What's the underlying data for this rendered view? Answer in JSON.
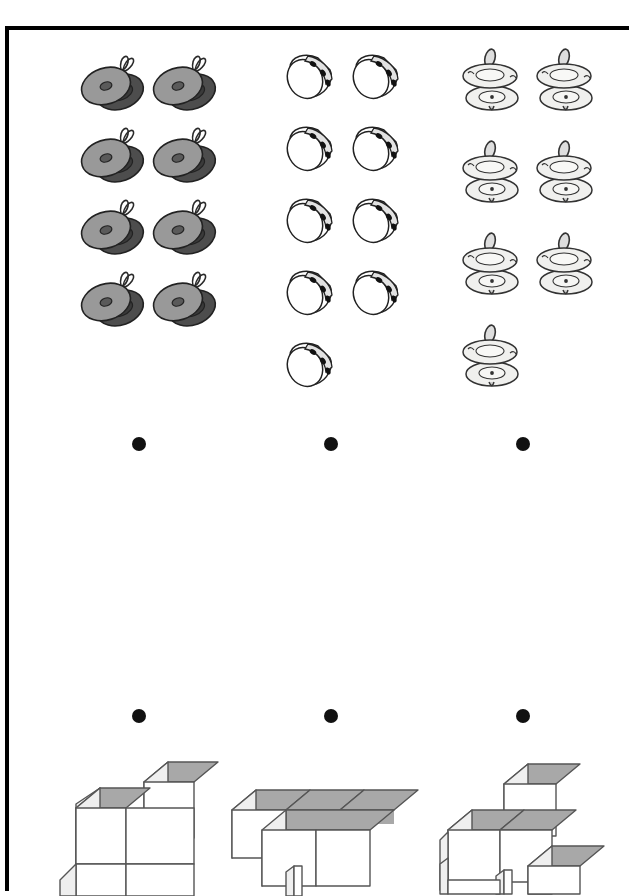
{
  "page": {
    "background_color": "#ffffff",
    "frame_color": "#000000",
    "width": 631,
    "height": 891
  },
  "worksheet": {
    "title": "",
    "instruction": ""
  },
  "groups": [
    {
      "id": "group-cymbals",
      "icon_name": "hand-cymbals-icon",
      "label": "",
      "count": 8,
      "rows": 4,
      "per_row": 2,
      "color": "#999999",
      "shadow_color": "#4d4d4d",
      "outline_color": "#222222"
    },
    {
      "id": "group-tambourines",
      "icon_name": "tambourine-icon",
      "label": "",
      "count": 9,
      "rows": 5,
      "per_row": 2,
      "color": "#ffffff",
      "shadow_color": "#c9c9c9",
      "outline_color": "#222222"
    },
    {
      "id": "group-finger-cymbals",
      "icon_name": "finger-cymbals-icon",
      "label": "",
      "count": 7,
      "rows": 4,
      "per_row": 2,
      "color": "#f0f0ee",
      "shadow_color": "#d8d8d4",
      "outline_color": "#333333"
    }
  ],
  "bullets": {
    "marker": "•",
    "color": "#111111",
    "row_top": [
      "answer-slot-1",
      "answer-slot-2",
      "answer-slot-3"
    ],
    "row_bottom": [
      "answer-slot-4",
      "answer-slot-5",
      "answer-slot-6"
    ]
  },
  "answers": {
    "row_top": [
      "",
      "",
      ""
    ],
    "row_bottom": [
      "",
      "",
      ""
    ]
  },
  "cube_figures": [
    {
      "id": "cube-figure-1",
      "name": "cube-stack-left",
      "cube_count": 4,
      "top_face_color": "#a8a8a8",
      "side_face_color": "#e8e8e8",
      "front_face_color": "#ffffff",
      "edge_color": "#555555"
    },
    {
      "id": "cube-figure-2",
      "name": "cube-stack-middle",
      "cube_count": 4,
      "top_face_color": "#a8a8a8",
      "side_face_color": "#e8e8e8",
      "front_face_color": "#ffffff",
      "edge_color": "#555555"
    },
    {
      "id": "cube-figure-3",
      "name": "cube-stack-right",
      "cube_count": 5,
      "top_face_color": "#a8a8a8",
      "side_face_color": "#e8e8e8",
      "front_face_color": "#ffffff",
      "edge_color": "#555555"
    }
  ]
}
